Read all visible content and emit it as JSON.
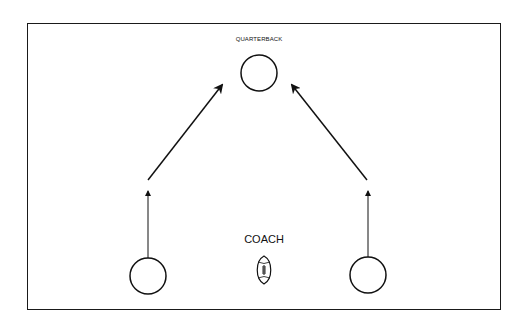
{
  "diagram": {
    "labels": {
      "quarterback": "QUARTERBACK",
      "coach": "COACH"
    },
    "players": [
      {
        "id": "quarterback",
        "cx": 259,
        "cy": 73,
        "r": 18
      },
      {
        "id": "left-player",
        "cx": 148,
        "cy": 276,
        "r": 18
      },
      {
        "id": "right-player",
        "cx": 368,
        "cy": 275,
        "r": 18
      }
    ],
    "icons": {
      "coach_ball": "football-icon"
    },
    "colors": {
      "stroke": "#111111",
      "background": "#ffffff"
    }
  }
}
